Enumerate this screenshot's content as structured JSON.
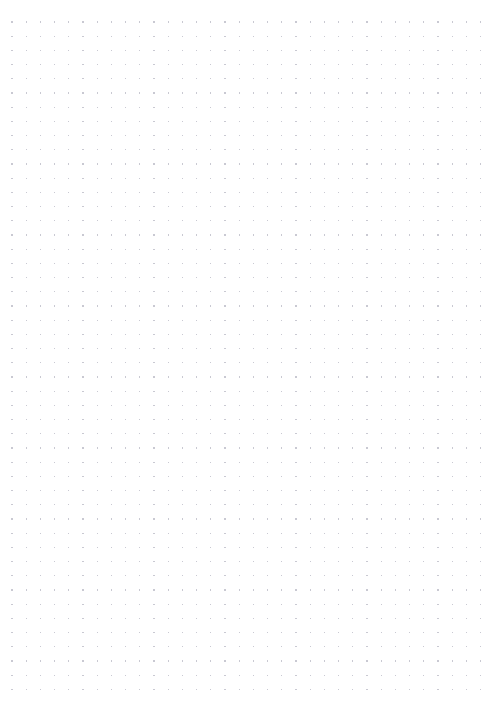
{
  "page": {
    "kind": "dot-grid-paper",
    "width_px": 497,
    "height_px": 714,
    "background_color": "#ffffff",
    "content_text": "",
    "has_text": false,
    "has_ui_chrome": false
  },
  "grid": {
    "dot_color": "#c9c9d2",
    "dot_radius_px": 0.6,
    "spacing_x_px": 14.2,
    "spacing_y_px": 14.2,
    "origin_x_px": 12,
    "origin_y_px": 22,
    "columns": 34,
    "rows": 48,
    "last_dot_x_px": 481,
    "last_dot_y_px": 695,
    "margin_right_px": 16,
    "margin_bottom_px": 19
  }
}
